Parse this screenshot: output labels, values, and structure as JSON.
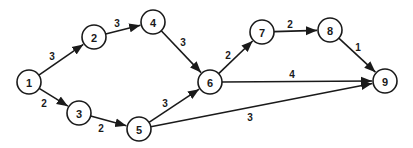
{
  "diagram": {
    "type": "network-graph",
    "style": {
      "stroke": "#1a1a1a",
      "fill": "#ffffff",
      "node_radius": 12
    },
    "nodes": [
      {
        "id": "1",
        "label": "1",
        "x": 29,
        "y": 82
      },
      {
        "id": "2",
        "label": "2",
        "x": 94,
        "y": 37
      },
      {
        "id": "3",
        "label": "3",
        "x": 79,
        "y": 113
      },
      {
        "id": "4",
        "label": "4",
        "x": 153,
        "y": 22
      },
      {
        "id": "5",
        "label": "5",
        "x": 139,
        "y": 129
      },
      {
        "id": "6",
        "label": "6",
        "x": 210,
        "y": 82
      },
      {
        "id": "7",
        "label": "7",
        "x": 262,
        "y": 32
      },
      {
        "id": "8",
        "label": "8",
        "x": 330,
        "y": 30
      },
      {
        "id": "9",
        "label": "9",
        "x": 385,
        "y": 81
      }
    ],
    "edges": [
      {
        "from": "1",
        "to": "2",
        "weight": "3",
        "label_x": 52,
        "label_y": 56
      },
      {
        "from": "1",
        "to": "3",
        "weight": "2",
        "label_x": 44,
        "label_y": 103
      },
      {
        "from": "2",
        "to": "4",
        "weight": "3",
        "label_x": 117,
        "label_y": 23
      },
      {
        "from": "3",
        "to": "5",
        "weight": "2",
        "label_x": 101,
        "label_y": 128
      },
      {
        "from": "4",
        "to": "6",
        "weight": "3",
        "label_x": 183,
        "label_y": 42
      },
      {
        "from": "5",
        "to": "6",
        "weight": "3",
        "label_x": 165,
        "label_y": 103
      },
      {
        "from": "5",
        "to": "9",
        "weight": "3",
        "label_x": 250,
        "label_y": 117
      },
      {
        "from": "6",
        "to": "7",
        "weight": "2",
        "label_x": 228,
        "label_y": 55
      },
      {
        "from": "6",
        "to": "9",
        "weight": "4",
        "label_x": 292,
        "label_y": 74
      },
      {
        "from": "7",
        "to": "8",
        "weight": "2",
        "label_x": 290,
        "label_y": 24
      },
      {
        "from": "8",
        "to": "9",
        "weight": "1",
        "label_x": 358,
        "label_y": 47
      }
    ]
  }
}
